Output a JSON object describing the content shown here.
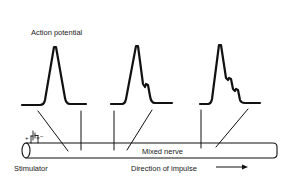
{
  "figure": {
    "title_label": "Action potential",
    "stimulator_label": "Stimulator",
    "nerve_label": "Mixed nerve",
    "direction_label": "Direction of impulse",
    "stimulator_plus": "+",
    "stimulator_minus": "−",
    "waveforms": [
      {
        "name": "recording-1",
        "description": "single sharp peak"
      },
      {
        "name": "recording-2",
        "description": "peak with one shoulder"
      },
      {
        "name": "recording-3",
        "description": "peak with two shoulders"
      }
    ],
    "colors": {
      "ink": "#111111",
      "background": "#ffffff"
    }
  }
}
